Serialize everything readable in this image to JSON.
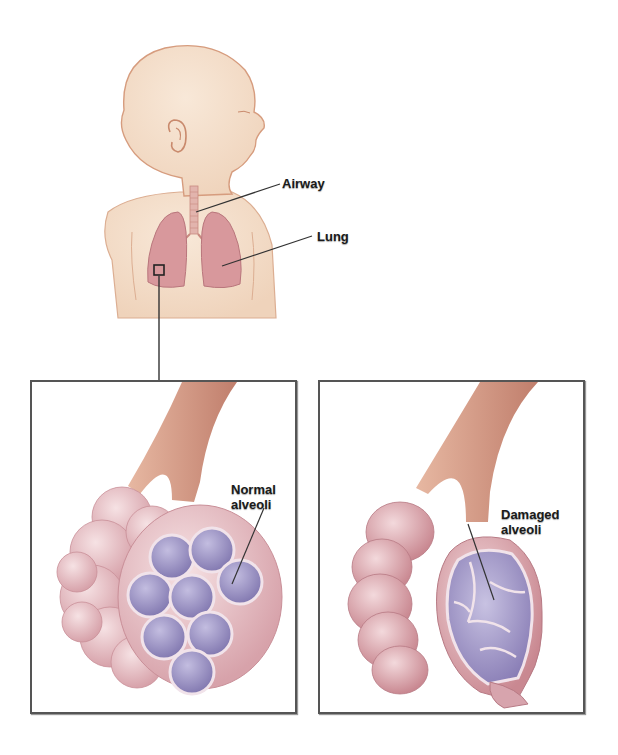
{
  "figure": {
    "labels": {
      "airway": "Airway",
      "lung": "Lung",
      "normal_line1": "Normal",
      "normal_line2": "alveoli",
      "damaged_line1": "Damaged",
      "damaged_line2": "alveoli"
    },
    "panels": [
      {
        "name": "normal-alveoli-panel",
        "caption": "Normal alveoli"
      },
      {
        "name": "damaged-alveoli-panel",
        "caption": "Damaged alveoli"
      }
    ],
    "colors": {
      "skin": "#f3dcc6",
      "skin_outline": "#d9a283",
      "lung": "#d99a9e",
      "alveoli_outer": "#e8bfc4",
      "alveoli_inner": "#9c94c4",
      "bronchus": "#d9987e",
      "frame": "#555555"
    }
  }
}
